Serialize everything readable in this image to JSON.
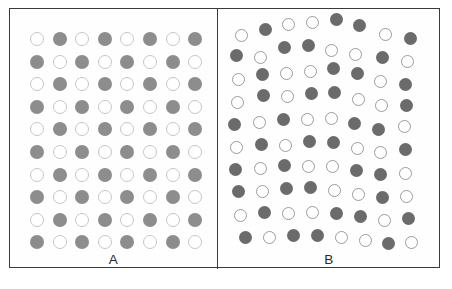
{
  "figure": {
    "title": "",
    "frame": {
      "x": 9,
      "y": 8,
      "width": 431,
      "height": 260,
      "border_color": "#3a3a3a"
    },
    "divider_x": 207,
    "background_color": "#ffffff"
  },
  "panels": [
    {
      "id": "A",
      "label": "A",
      "arrangement": "regular-checkerboard-lattice",
      "rows": 10,
      "cols": 8,
      "origin": {
        "x": 27,
        "y": 30
      },
      "spacing": {
        "x": 22.6,
        "y": 22.6
      },
      "dot": {
        "diameter": 14,
        "filled_color": "#8d8d8d",
        "open_fill": "#ffffff",
        "open_stroke_color": "#c6c6c6",
        "open_stroke_width": 1.7
      },
      "pattern": [
        [
          0,
          1,
          0,
          1,
          0,
          1,
          0,
          1
        ],
        [
          1,
          0,
          1,
          0,
          1,
          0,
          1,
          0
        ],
        [
          0,
          1,
          0,
          1,
          0,
          1,
          0,
          1
        ],
        [
          1,
          0,
          1,
          0,
          1,
          0,
          1,
          0
        ],
        [
          0,
          1,
          0,
          1,
          0,
          1,
          0,
          1
        ],
        [
          1,
          0,
          1,
          0,
          1,
          0,
          1,
          0
        ],
        [
          0,
          1,
          0,
          1,
          0,
          1,
          0,
          1
        ],
        [
          1,
          0,
          1,
          0,
          1,
          0,
          1,
          0
        ],
        [
          0,
          1,
          0,
          1,
          0,
          1,
          0,
          1
        ],
        [
          1,
          0,
          1,
          0,
          1,
          0,
          1,
          0
        ]
      ]
    },
    {
      "id": "B",
      "label": "B",
      "arrangement": "jittered-irregular-lattice",
      "rows": 10,
      "cols": 8,
      "dot": {
        "diameter": 13,
        "filled_color": "#6b6b6b",
        "open_fill": "#ffffff",
        "open_stroke_color": "#9b9b9b",
        "open_stroke_width": 1.8
      },
      "dots": [
        {
          "x": 23,
          "y": 26,
          "filled": 0
        },
        {
          "x": 47,
          "y": 20,
          "filled": 1
        },
        {
          "x": 70,
          "y": 15,
          "filled": 0
        },
        {
          "x": 94,
          "y": 13,
          "filled": 0
        },
        {
          "x": 118,
          "y": 10,
          "filled": 1
        },
        {
          "x": 141,
          "y": 16,
          "filled": 1
        },
        {
          "x": 167,
          "y": 25,
          "filled": 0
        },
        {
          "x": 192,
          "y": 29,
          "filled": 1
        },
        {
          "x": 18,
          "y": 46,
          "filled": 1
        },
        {
          "x": 42,
          "y": 48,
          "filled": 0
        },
        {
          "x": 66,
          "y": 38,
          "filled": 1
        },
        {
          "x": 90,
          "y": 36,
          "filled": 1
        },
        {
          "x": 113,
          "y": 41,
          "filled": 0
        },
        {
          "x": 137,
          "y": 45,
          "filled": 0
        },
        {
          "x": 164,
          "y": 48,
          "filled": 1
        },
        {
          "x": 189,
          "y": 52,
          "filled": 0
        },
        {
          "x": 20,
          "y": 70,
          "filled": 0
        },
        {
          "x": 44,
          "y": 65,
          "filled": 1
        },
        {
          "x": 68,
          "y": 64,
          "filled": 0
        },
        {
          "x": 92,
          "y": 62,
          "filled": 0
        },
        {
          "x": 115,
          "y": 59,
          "filled": 1
        },
        {
          "x": 139,
          "y": 64,
          "filled": 1
        },
        {
          "x": 162,
          "y": 72,
          "filled": 0
        },
        {
          "x": 187,
          "y": 75,
          "filled": 1
        },
        {
          "x": 19,
          "y": 93,
          "filled": 0
        },
        {
          "x": 45,
          "y": 86,
          "filled": 1
        },
        {
          "x": 69,
          "y": 87,
          "filled": 0
        },
        {
          "x": 93,
          "y": 84,
          "filled": 1
        },
        {
          "x": 116,
          "y": 83,
          "filled": 1
        },
        {
          "x": 140,
          "y": 90,
          "filled": 0
        },
        {
          "x": 163,
          "y": 96,
          "filled": 0
        },
        {
          "x": 188,
          "y": 96,
          "filled": 1
        },
        {
          "x": 16,
          "y": 115,
          "filled": 1
        },
        {
          "x": 41,
          "y": 113,
          "filled": 0
        },
        {
          "x": 65,
          "y": 110,
          "filled": 1
        },
        {
          "x": 89,
          "y": 110,
          "filled": 0
        },
        {
          "x": 113,
          "y": 109,
          "filled": 0
        },
        {
          "x": 136,
          "y": 114,
          "filled": 1
        },
        {
          "x": 160,
          "y": 120,
          "filled": 1
        },
        {
          "x": 186,
          "y": 117,
          "filled": 0
        },
        {
          "x": 18,
          "y": 138,
          "filled": 0
        },
        {
          "x": 43,
          "y": 135,
          "filled": 1
        },
        {
          "x": 67,
          "y": 136,
          "filled": 0
        },
        {
          "x": 91,
          "y": 132,
          "filled": 1
        },
        {
          "x": 115,
          "y": 133,
          "filled": 1
        },
        {
          "x": 139,
          "y": 139,
          "filled": 0
        },
        {
          "x": 162,
          "y": 143,
          "filled": 0
        },
        {
          "x": 187,
          "y": 140,
          "filled": 1
        },
        {
          "x": 17,
          "y": 160,
          "filled": 1
        },
        {
          "x": 42,
          "y": 159,
          "filled": 0
        },
        {
          "x": 66,
          "y": 156,
          "filled": 1
        },
        {
          "x": 90,
          "y": 157,
          "filled": 0
        },
        {
          "x": 114,
          "y": 157,
          "filled": 0
        },
        {
          "x": 138,
          "y": 161,
          "filled": 1
        },
        {
          "x": 162,
          "y": 165,
          "filled": 1
        },
        {
          "x": 187,
          "y": 164,
          "filled": 0
        },
        {
          "x": 20,
          "y": 182,
          "filled": 1
        },
        {
          "x": 44,
          "y": 182,
          "filled": 0
        },
        {
          "x": 68,
          "y": 179,
          "filled": 1
        },
        {
          "x": 92,
          "y": 178,
          "filled": 1
        },
        {
          "x": 116,
          "y": 181,
          "filled": 0
        },
        {
          "x": 140,
          "y": 185,
          "filled": 0
        },
        {
          "x": 164,
          "y": 188,
          "filled": 1
        },
        {
          "x": 188,
          "y": 187,
          "filled": 0
        },
        {
          "x": 22,
          "y": 206,
          "filled": 0
        },
        {
          "x": 46,
          "y": 203,
          "filled": 1
        },
        {
          "x": 70,
          "y": 204,
          "filled": 0
        },
        {
          "x": 94,
          "y": 203,
          "filled": 0
        },
        {
          "x": 118,
          "y": 204,
          "filled": 1
        },
        {
          "x": 142,
          "y": 207,
          "filled": 1
        },
        {
          "x": 166,
          "y": 211,
          "filled": 0
        },
        {
          "x": 190,
          "y": 209,
          "filled": 1
        },
        {
          "x": 27,
          "y": 228,
          "filled": 1
        },
        {
          "x": 51,
          "y": 228,
          "filled": 0
        },
        {
          "x": 75,
          "y": 226,
          "filled": 1
        },
        {
          "x": 99,
          "y": 226,
          "filled": 1
        },
        {
          "x": 123,
          "y": 228,
          "filled": 0
        },
        {
          "x": 147,
          "y": 231,
          "filled": 0
        },
        {
          "x": 170,
          "y": 234,
          "filled": 1
        },
        {
          "x": 193,
          "y": 233,
          "filled": 0
        }
      ]
    }
  ],
  "caption": {
    "text": ""
  }
}
